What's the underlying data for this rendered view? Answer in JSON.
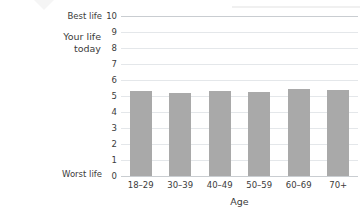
{
  "chart_data": {
    "type": "bar",
    "title": "",
    "xlabel": "Age",
    "ylabel": "Your life today",
    "categories": [
      "18–29",
      "30–39",
      "40–49",
      "50–59",
      "60–69",
      "70+"
    ],
    "values": [
      5.3,
      5.2,
      5.3,
      5.25,
      5.45,
      5.4
    ],
    "ylim": [
      0,
      10
    ],
    "ytick_labels": [
      "10",
      "9",
      "8",
      "7",
      "6",
      "5",
      "4",
      "3",
      "2",
      "1",
      "0"
    ],
    "ytick_values": [
      10,
      9,
      8,
      7,
      6,
      5,
      4,
      3,
      2,
      1,
      0
    ],
    "y_axis_top_annotation": "Best life",
    "y_axis_bottom_annotation": "Worst life",
    "grid": true,
    "legend": "none",
    "bar_color": "#a9a9a9",
    "gridline_color": "#e4e7ea",
    "axis_color": "#c9cdd1"
  },
  "labels": {
    "your_life_today": "Your life\ntoday",
    "your_life_today_line1": "Your life",
    "your_life_today_line2": "today",
    "best_life": "Best life",
    "worst_life": "Worst life",
    "age_axis": "Age"
  }
}
